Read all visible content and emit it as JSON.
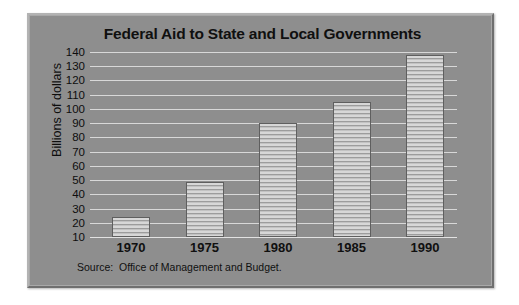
{
  "chart_data": {
    "type": "bar",
    "title": "Federal Aid to State and Local Governments",
    "xlabel": "",
    "ylabel": "Billions of dollars",
    "categories": [
      "1970",
      "1975",
      "1980",
      "1985",
      "1990"
    ],
    "values": [
      24,
      49,
      90,
      105,
      138
    ],
    "ylim": [
      10,
      140
    ],
    "yticks": [
      140,
      130,
      120,
      110,
      100,
      90,
      80,
      70,
      60,
      50,
      40,
      30,
      20,
      10
    ],
    "ytick_labels": [
      "140",
      "130",
      "120",
      "110",
      "100",
      "90",
      "80",
      "70",
      "60",
      "50",
      "40",
      "30",
      "20",
      "10"
    ],
    "grid": true,
    "legend": "none",
    "series": [
      {
        "name": "Federal aid",
        "values": [
          24,
          49,
          90,
          105,
          138
        ]
      }
    ],
    "annotations": [
      "Source:  Office of Management and Budget."
    ],
    "colors": {
      "plate_background": "#8e8e8e",
      "bar_fill": "#c9c9c9",
      "bar_hatch": "#9c9c9c",
      "bar_edge": "#5f5f5f",
      "gridline": "#d8d8d8",
      "text": "#101010"
    }
  },
  "figure": {
    "title": "Federal Aid to State and Local Governments",
    "source_note": "Source:  Office of Management and Budget."
  }
}
